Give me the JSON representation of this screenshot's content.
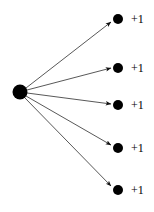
{
  "figure": {
    "type": "node-link-diagram",
    "background_color": "#ffffff",
    "ink_color": "#000000",
    "edge_color": "#3a3a3a",
    "width": 154,
    "height": 212
  },
  "source_node": {
    "label": "",
    "cx": 20,
    "cy": 92,
    "r": 7.5
  },
  "branches": [
    {
      "label": "+1",
      "cx": 118,
      "cy": 19,
      "r": 5.0,
      "label_x": 131,
      "label_y": 19
    },
    {
      "label": "+1",
      "cx": 118,
      "cy": 68,
      "r": 5.0,
      "label_x": 131,
      "label_y": 68
    },
    {
      "label": "+1",
      "cx": 118,
      "cy": 105,
      "r": 5.0,
      "label_x": 131,
      "label_y": 105
    },
    {
      "label": "+1",
      "cx": 118,
      "cy": 148,
      "r": 5.0,
      "label_x": 131,
      "label_y": 148
    },
    {
      "label": "+1",
      "cx": 118,
      "cy": 190,
      "r": 5.0,
      "label_x": 131,
      "label_y": 190
    }
  ],
  "edges": [
    {
      "x1": 26,
      "y1": 88,
      "x2": 111,
      "y2": 22
    },
    {
      "x1": 27,
      "y1": 90,
      "x2": 111,
      "y2": 68
    },
    {
      "x1": 27,
      "y1": 93,
      "x2": 111,
      "y2": 104
    },
    {
      "x1": 26,
      "y1": 96,
      "x2": 111,
      "y2": 145
    },
    {
      "x1": 25,
      "y1": 98,
      "x2": 111,
      "y2": 186
    }
  ]
}
